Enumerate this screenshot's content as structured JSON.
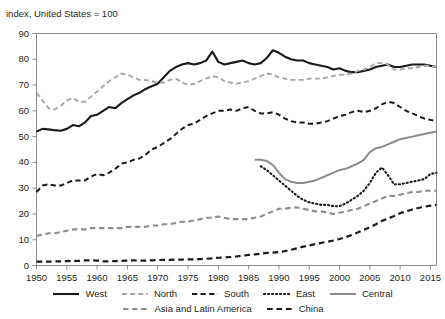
{
  "subtitle": "index, United States = 100",
  "legend": {
    "row1": [
      {
        "label": "West",
        "key": "west"
      },
      {
        "label": "North",
        "key": "north"
      },
      {
        "label": "South",
        "key": "south"
      },
      {
        "label": "East",
        "key": "east"
      },
      {
        "label": "Central",
        "key": "central"
      }
    ],
    "row2": [
      {
        "label": "Asia and Latin America",
        "key": "asia_latin_america"
      },
      {
        "label": "China",
        "key": "china"
      }
    ]
  },
  "colors": {
    "black": "#1a1a1a",
    "gray": "#8c8c8c",
    "axis": "#8c8c8c",
    "text": "#231f20",
    "background": "#ffffff"
  },
  "chart_data": {
    "type": "line",
    "title": "",
    "subtitle": "index, United States = 100",
    "xlabel": "",
    "ylabel": "index, United States = 100",
    "xlim": [
      1950,
      2016
    ],
    "ylim": [
      0,
      90
    ],
    "ytick_values": [
      0,
      10,
      20,
      30,
      40,
      50,
      60,
      70,
      80,
      90
    ],
    "xtick_values": [
      1950,
      1955,
      1960,
      1965,
      1970,
      1975,
      1980,
      1985,
      1990,
      1995,
      2000,
      2005,
      2010,
      2015
    ],
    "grid": false,
    "legend_position": "bottom",
    "series": [
      {
        "name": "West",
        "style": "solid",
        "color": "#1a1a1a",
        "width": 2.1,
        "x": [
          1950,
          1951,
          1952,
          1953,
          1954,
          1955,
          1956,
          1957,
          1958,
          1959,
          1960,
          1961,
          1962,
          1963,
          1964,
          1965,
          1966,
          1967,
          1968,
          1969,
          1970,
          1971,
          1972,
          1973,
          1974,
          1975,
          1976,
          1977,
          1978,
          1979,
          1980,
          1981,
          1982,
          1983,
          1984,
          1985,
          1986,
          1987,
          1988,
          1989,
          1990,
          1991,
          1992,
          1993,
          1994,
          1995,
          1996,
          1997,
          1998,
          1999,
          2000,
          2001,
          2002,
          2003,
          2004,
          2005,
          2006,
          2007,
          2008,
          2009,
          2010,
          2011,
          2012,
          2013,
          2014,
          2015,
          2016
        ],
        "y": [
          52.0,
          53.0,
          52.8,
          52.5,
          52.3,
          53.0,
          54.5,
          54.0,
          55.5,
          58.0,
          58.5,
          60.0,
          61.5,
          61.0,
          63.0,
          64.5,
          66.0,
          67.0,
          68.5,
          69.5,
          70.5,
          73.0,
          75.5,
          77.0,
          78.0,
          78.5,
          78.0,
          78.5,
          79.5,
          83.0,
          79.0,
          78.0,
          78.5,
          79.0,
          79.5,
          78.5,
          78.0,
          78.5,
          80.5,
          83.5,
          82.5,
          81.0,
          80.0,
          79.5,
          79.5,
          78.5,
          78.0,
          77.5,
          77.0,
          76.0,
          76.5,
          75.5,
          75.0,
          75.0,
          75.5,
          76.0,
          77.0,
          77.5,
          78.0,
          77.0,
          77.0,
          77.5,
          78.0,
          78.0,
          78.0,
          77.5,
          77.0
        ]
      },
      {
        "name": "North",
        "style": "dashed",
        "color": "#a6a6a6",
        "width": 1.9,
        "x": [
          1950,
          1951,
          1952,
          1953,
          1954,
          1955,
          1956,
          1957,
          1958,
          1959,
          1960,
          1961,
          1962,
          1963,
          1964,
          1965,
          1966,
          1967,
          1968,
          1969,
          1970,
          1971,
          1972,
          1973,
          1974,
          1975,
          1976,
          1977,
          1978,
          1979,
          1980,
          1981,
          1982,
          1983,
          1984,
          1985,
          1986,
          1987,
          1988,
          1989,
          1990,
          1991,
          1992,
          1993,
          1994,
          1995,
          1996,
          1997,
          1998,
          1999,
          2000,
          2001,
          2002,
          2003,
          2004,
          2005,
          2006,
          2007,
          2008,
          2009,
          2010,
          2011,
          2012,
          2013,
          2014,
          2015,
          2016
        ],
        "y": [
          67.0,
          64.0,
          61.0,
          60.5,
          62.0,
          64.0,
          65.0,
          63.5,
          63.5,
          65.5,
          67.5,
          69.5,
          71.5,
          73.0,
          74.5,
          74.0,
          73.0,
          72.0,
          72.0,
          71.5,
          71.0,
          71.0,
          72.0,
          72.5,
          71.0,
          70.0,
          70.5,
          71.5,
          72.5,
          73.5,
          73.0,
          71.5,
          71.0,
          70.5,
          71.0,
          71.5,
          72.5,
          73.5,
          74.5,
          74.0,
          73.0,
          72.5,
          72.0,
          72.0,
          72.0,
          72.5,
          72.5,
          72.5,
          73.0,
          73.5,
          74.0,
          74.0,
          74.5,
          75.5,
          76.0,
          77.0,
          78.5,
          78.5,
          78.0,
          76.0,
          76.0,
          76.5,
          76.5,
          77.0,
          77.5,
          77.5,
          77.0
        ]
      },
      {
        "name": "South",
        "style": "dashed",
        "color": "#1a1a1a",
        "width": 2.0,
        "x": [
          1950,
          1951,
          1952,
          1953,
          1954,
          1955,
          1956,
          1957,
          1958,
          1959,
          1960,
          1961,
          1962,
          1963,
          1964,
          1965,
          1966,
          1967,
          1968,
          1969,
          1970,
          1971,
          1972,
          1973,
          1974,
          1975,
          1976,
          1977,
          1978,
          1979,
          1980,
          1981,
          1982,
          1983,
          1984,
          1985,
          1986,
          1987,
          1988,
          1989,
          1990,
          1991,
          1992,
          1993,
          1994,
          1995,
          1996,
          1997,
          1998,
          1999,
          2000,
          2001,
          2002,
          2003,
          2004,
          2005,
          2006,
          2007,
          2008,
          2009,
          2010,
          2011,
          2012,
          2013,
          2014,
          2015,
          2016
        ],
        "y": [
          28.5,
          31.0,
          31.5,
          31.0,
          31.0,
          32.0,
          33.0,
          33.0,
          33.0,
          34.5,
          35.5,
          35.0,
          36.0,
          37.5,
          39.5,
          40.0,
          41.0,
          41.5,
          43.0,
          45.0,
          46.0,
          47.5,
          49.0,
          51.0,
          53.0,
          54.5,
          55.0,
          56.5,
          58.0,
          59.0,
          60.0,
          60.0,
          60.5,
          60.0,
          61.0,
          61.5,
          60.0,
          59.0,
          59.0,
          59.5,
          58.5,
          57.0,
          56.0,
          55.5,
          55.5,
          55.0,
          55.0,
          55.5,
          56.0,
          57.0,
          58.0,
          58.5,
          59.5,
          60.0,
          59.5,
          60.0,
          61.0,
          62.5,
          63.5,
          63.0,
          61.5,
          60.0,
          59.0,
          58.0,
          57.0,
          56.5,
          56.0
        ]
      },
      {
        "name": "East",
        "style": "dotted",
        "color": "#1a1a1a",
        "width": 2.1,
        "x": [
          1987,
          1988,
          1989,
          1990,
          1991,
          1992,
          1993,
          1994,
          1995,
          1996,
          1997,
          1998,
          1999,
          2000,
          2001,
          2002,
          2003,
          2004,
          2005,
          2006,
          2007,
          2008,
          2009,
          2010,
          2011,
          2012,
          2013,
          2014,
          2015,
          2016
        ],
        "y": [
          38.5,
          37.0,
          35.0,
          33.0,
          31.0,
          29.0,
          27.0,
          25.5,
          24.5,
          24.0,
          23.5,
          23.5,
          23.0,
          23.0,
          24.0,
          25.5,
          27.0,
          29.0,
          32.0,
          36.0,
          38.0,
          35.0,
          31.5,
          31.5,
          32.0,
          32.5,
          33.0,
          33.5,
          35.5,
          36.0
        ]
      },
      {
        "name": "Central",
        "style": "solid",
        "color": "#8c8c8c",
        "width": 2.0,
        "x": [
          1986,
          1987,
          1988,
          1989,
          1990,
          1991,
          1992,
          1993,
          1994,
          1995,
          1996,
          1997,
          1998,
          1999,
          2000,
          2001,
          2002,
          2003,
          2004,
          2005,
          2006,
          2007,
          2008,
          2009,
          2010,
          2011,
          2012,
          2013,
          2014,
          2015,
          2016
        ],
        "y": [
          41.0,
          41.0,
          40.5,
          39.0,
          36.0,
          33.5,
          32.5,
          32.0,
          32.0,
          32.5,
          33.0,
          34.0,
          35.0,
          36.0,
          37.0,
          37.5,
          38.5,
          39.5,
          41.0,
          44.0,
          45.5,
          46.0,
          47.0,
          48.0,
          49.0,
          49.5,
          50.0,
          50.5,
          51.0,
          51.5,
          52.0
        ]
      },
      {
        "name": "Asia and Latin America",
        "style": "dashed",
        "color": "#8c8c8c",
        "width": 2.1,
        "x": [
          1950,
          1951,
          1952,
          1953,
          1954,
          1955,
          1956,
          1957,
          1958,
          1959,
          1960,
          1961,
          1962,
          1963,
          1964,
          1965,
          1966,
          1967,
          1968,
          1969,
          1970,
          1971,
          1972,
          1973,
          1974,
          1975,
          1976,
          1977,
          1978,
          1979,
          1980,
          1981,
          1982,
          1983,
          1984,
          1985,
          1986,
          1987,
          1988,
          1989,
          1990,
          1991,
          1992,
          1993,
          1994,
          1995,
          1996,
          1997,
          1998,
          1999,
          2000,
          2001,
          2002,
          2003,
          2004,
          2005,
          2006,
          2007,
          2008,
          2009,
          2010,
          2011,
          2012,
          2013,
          2014,
          2015,
          2016
        ],
        "y": [
          11.5,
          12.0,
          12.5,
          12.5,
          13.0,
          13.5,
          14.0,
          14.0,
          14.0,
          14.5,
          14.5,
          14.5,
          14.5,
          14.5,
          14.5,
          15.0,
          15.0,
          15.0,
          15.0,
          15.5,
          15.5,
          16.0,
          16.0,
          16.5,
          17.0,
          17.0,
          17.5,
          18.0,
          18.5,
          18.5,
          19.0,
          18.5,
          18.0,
          18.0,
          18.0,
          18.0,
          18.5,
          19.0,
          20.0,
          21.0,
          22.0,
          22.0,
          22.5,
          22.5,
          22.0,
          21.5,
          21.0,
          21.0,
          20.5,
          20.0,
          20.5,
          21.0,
          21.5,
          22.0,
          23.0,
          24.0,
          25.0,
          26.0,
          27.0,
          27.0,
          27.5,
          28.0,
          28.5,
          28.5,
          29.0,
          29.0,
          29.0
        ]
      },
      {
        "name": "China",
        "style": "dashed",
        "color": "#1a1a1a",
        "width": 2.2,
        "x": [
          1950,
          1951,
          1952,
          1953,
          1954,
          1955,
          1956,
          1957,
          1958,
          1959,
          1960,
          1961,
          1962,
          1963,
          1964,
          1965,
          1966,
          1967,
          1968,
          1969,
          1970,
          1971,
          1972,
          1973,
          1974,
          1975,
          1976,
          1977,
          1978,
          1979,
          1980,
          1981,
          1982,
          1983,
          1984,
          1985,
          1986,
          1987,
          1988,
          1989,
          1990,
          1991,
          1992,
          1993,
          1994,
          1995,
          1996,
          1997,
          1998,
          1999,
          2000,
          2001,
          2002,
          2003,
          2004,
          2005,
          2006,
          2007,
          2008,
          2009,
          2010,
          2011,
          2012,
          2013,
          2014,
          2015,
          2016
        ],
        "y": [
          1.5,
          1.5,
          1.5,
          1.6,
          1.6,
          1.7,
          1.8,
          1.8,
          2.0,
          2.0,
          1.9,
          1.6,
          1.6,
          1.7,
          1.8,
          1.9,
          2.0,
          1.9,
          1.9,
          2.0,
          2.1,
          2.2,
          2.2,
          2.3,
          2.3,
          2.4,
          2.4,
          2.5,
          2.6,
          2.8,
          3.0,
          3.1,
          3.3,
          3.5,
          3.8,
          4.1,
          4.3,
          4.6,
          4.9,
          5.0,
          5.2,
          5.6,
          6.1,
          6.7,
          7.3,
          7.8,
          8.3,
          8.8,
          9.2,
          9.7,
          10.3,
          11.0,
          11.8,
          12.8,
          13.8,
          14.8,
          16.0,
          17.3,
          18.2,
          19.2,
          20.3,
          21.0,
          21.7,
          22.3,
          22.8,
          23.2,
          23.5
        ]
      }
    ]
  }
}
